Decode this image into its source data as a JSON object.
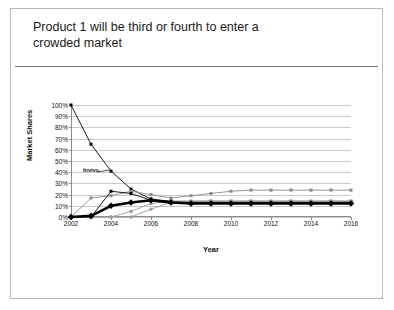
{
  "slide": {
    "title": "Product 1 will be third or fourth to enter a\ncrowded market"
  },
  "chart_data": {
    "type": "line",
    "title": "",
    "xlabel": "Year",
    "ylabel": "Market Shares",
    "xlim": [
      2002,
      2016
    ],
    "ylim": [
      0,
      100
    ],
    "grid": true,
    "legend": false,
    "x": [
      2002,
      2003,
      2004,
      2005,
      2006,
      2007,
      2008,
      2009,
      2010,
      2011,
      2012,
      2013,
      2014,
      2015,
      2016
    ],
    "xtick_labels": [
      "2002",
      "2004",
      "2006",
      "2008",
      "2010",
      "2012",
      "2014",
      "2016"
    ],
    "xtick_values": [
      2002,
      2004,
      2006,
      2008,
      2010,
      2012,
      2014,
      2016
    ],
    "ytick_labels": [
      "0%",
      "10%",
      "20%",
      "30%",
      "40%",
      "50%",
      "60%",
      "70%",
      "80%",
      "90%",
      "100%"
    ],
    "ytick_values": [
      0,
      10,
      20,
      30,
      40,
      50,
      60,
      70,
      80,
      90,
      100
    ],
    "annotations": [
      {
        "text": "Invivo",
        "x": 2002.6,
        "y": 41,
        "leader_to_x": 2004,
        "leader_to_y": 41
      }
    ],
    "series": [
      {
        "name": "Invivo",
        "style": "thin",
        "color": "#000000",
        "values": [
          100,
          65,
          41,
          25,
          16,
          14,
          13,
          13,
          13,
          13,
          13,
          13,
          13,
          13,
          13
        ]
      },
      {
        "name": "Competitor A",
        "style": "thin-gray",
        "color": "#8c8c8c",
        "values": [
          0,
          17,
          19,
          23,
          20,
          17,
          19,
          21,
          23,
          24,
          24,
          24,
          24,
          24,
          24
        ]
      },
      {
        "name": "Competitor B",
        "style": "thin",
        "color": "#000000",
        "values": [
          0,
          0,
          23,
          21,
          15,
          14,
          14,
          14,
          14,
          14,
          14,
          14,
          14,
          14,
          14
        ]
      },
      {
        "name": "Competitor C",
        "style": "thin-gray",
        "color": "#9a9a9a",
        "values": [
          0,
          0,
          0,
          5,
          12,
          14,
          14,
          14,
          14,
          14,
          14,
          14,
          14,
          14,
          14
        ]
      },
      {
        "name": "Competitor D",
        "style": "thin-gray",
        "color": "#9a9a9a",
        "values": [
          0,
          0,
          0,
          0,
          7,
          13,
          14,
          14,
          14,
          14,
          14,
          14,
          14,
          14,
          14
        ]
      },
      {
        "name": "Product 1",
        "style": "bold",
        "color": "#000000",
        "values": [
          0,
          1,
          10,
          13,
          15,
          13,
          12,
          12,
          12,
          12,
          12,
          12,
          12,
          12,
          12
        ]
      }
    ]
  }
}
